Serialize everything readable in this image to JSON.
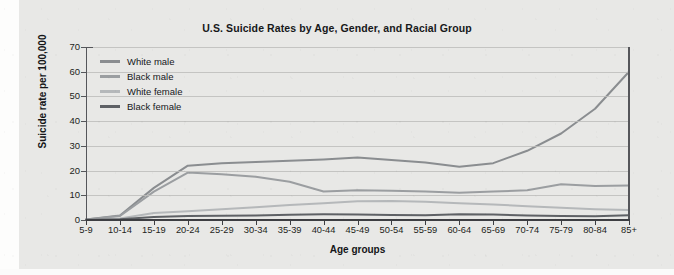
{
  "chart_data": {
    "type": "line",
    "title": "U.S. Suicide Rates by Age, Gender, and Racial Group",
    "xlabel": "Age groups",
    "ylabel": "Suicide rate per 100,000",
    "categories": [
      "5-9",
      "10-14",
      "15-19",
      "20-24",
      "25-29",
      "30-34",
      "35-39",
      "40-44",
      "45-49",
      "50-54",
      "55-59",
      "60-64",
      "65-69",
      "70-74",
      "75-79",
      "80-84",
      "85+"
    ],
    "ylim": [
      0,
      70
    ],
    "yticks": [
      0,
      10,
      20,
      30,
      40,
      50,
      60,
      70
    ],
    "grid": true,
    "legend_position": "top-left",
    "series": [
      {
        "name": "White male",
        "color": "#8a8d90",
        "values": [
          0.2,
          1.8,
          13.0,
          22.0,
          23.0,
          23.5,
          24.0,
          24.5,
          25.3,
          24.3,
          23.3,
          21.5,
          23.0,
          28.0,
          35.0,
          45.0,
          60.0
        ]
      },
      {
        "name": "Black male",
        "color": "#9b9ea1",
        "values": [
          0.2,
          1.6,
          11.5,
          19.2,
          18.5,
          17.5,
          15.5,
          11.5,
          12.0,
          11.8,
          11.5,
          11.0,
          11.5,
          12.0,
          14.5,
          13.8,
          14.0
        ]
      },
      {
        "name": "White female",
        "color": "#b5b8ba",
        "values": [
          0.1,
          0.6,
          2.8,
          3.5,
          4.3,
          5.2,
          6.1,
          6.8,
          7.6,
          7.7,
          7.4,
          6.8,
          6.3,
          5.6,
          5.0,
          4.4,
          4.0
        ]
      },
      {
        "name": "Black female",
        "color": "#5e6165",
        "values": [
          0.1,
          0.3,
          1.2,
          1.6,
          1.7,
          1.8,
          2.1,
          2.3,
          2.2,
          2.0,
          1.9,
          2.3,
          2.2,
          1.8,
          1.6,
          1.5,
          1.9
        ]
      }
    ]
  }
}
